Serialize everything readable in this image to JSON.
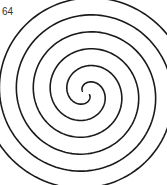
{
  "figure": {
    "label": "64",
    "stroke_color": "#1a1a1a",
    "stroke_width": 1.6,
    "spiral": {
      "center": [
        86,
        93
      ],
      "arms": 2,
      "turns": 3.0,
      "growth_per_turn": 34,
      "start_radius": 4
    }
  }
}
